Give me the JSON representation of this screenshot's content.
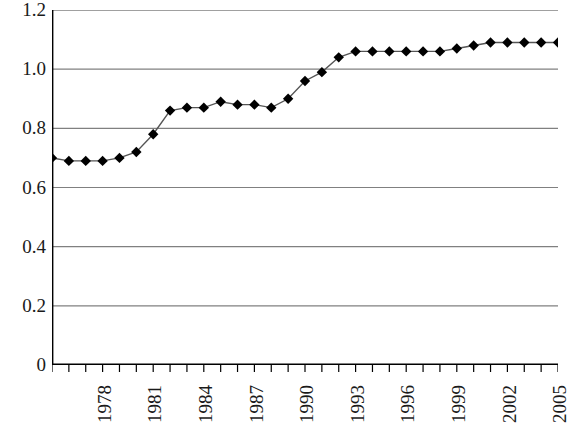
{
  "chart_data": {
    "type": "line",
    "title": "",
    "subtitle": "",
    "xlabel": "",
    "ylabel": "",
    "grid": true,
    "legend": false,
    "legend_position": "none",
    "marker": "diamond",
    "marker_color": "#000000",
    "line_color": "#555555",
    "gridline_color": "#808080",
    "axis_color": "#000000",
    "background": "#ffffff",
    "xlim": [
      1976,
      2006
    ],
    "ylim": [
      0,
      1.2
    ],
    "ytick_labels": [
      "1.2",
      "1.0",
      "0.8",
      "0.6",
      "0.4",
      "0.2",
      "0"
    ],
    "ytick_values": [
      1.2,
      1.0,
      0.8,
      0.6,
      0.4,
      0.2,
      0
    ],
    "xtick_labels": [
      "1978",
      "1981",
      "1984",
      "1987",
      "1990",
      "1993",
      "1996",
      "1999",
      "2002",
      "2005"
    ],
    "xtick_label_values": [
      1978,
      1981,
      1984,
      1987,
      1990,
      1993,
      1996,
      1999,
      2002,
      2005
    ],
    "x": [
      1976,
      1977,
      1978,
      1979,
      1980,
      1981,
      1982,
      1983,
      1984,
      1985,
      1986,
      1987,
      1988,
      1989,
      1990,
      1991,
      1992,
      1993,
      1994,
      1995,
      1996,
      1997,
      1998,
      1999,
      2000,
      2001,
      2002,
      2003,
      2004,
      2005,
      2006
    ],
    "values": [
      0.7,
      0.69,
      0.69,
      0.69,
      0.7,
      0.72,
      0.78,
      0.86,
      0.87,
      0.87,
      0.89,
      0.88,
      0.88,
      0.87,
      0.9,
      0.96,
      0.99,
      1.04,
      1.06,
      1.06,
      1.06,
      1.06,
      1.06,
      1.06,
      1.07,
      1.08,
      1.09,
      1.09,
      1.09,
      1.09,
      1.09
    ],
    "series": [
      {
        "name": "series-1",
        "values": [
          0.7,
          0.69,
          0.69,
          0.69,
          0.7,
          0.72,
          0.78,
          0.86,
          0.87,
          0.87,
          0.89,
          0.88,
          0.88,
          0.87,
          0.9,
          0.96,
          0.99,
          1.04,
          1.06,
          1.06,
          1.06,
          1.06,
          1.06,
          1.06,
          1.07,
          1.08,
          1.09,
          1.09,
          1.09,
          1.09,
          1.09
        ]
      }
    ]
  }
}
